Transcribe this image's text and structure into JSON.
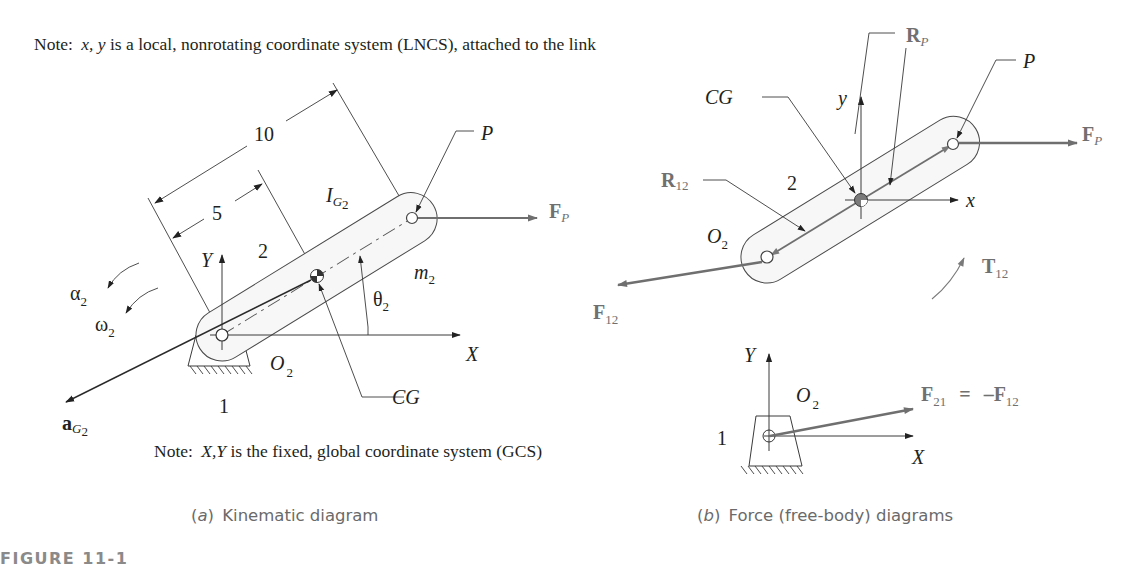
{
  "figure": {
    "number": "FIGURE 11-1",
    "top_note": {
      "prefix": "Note:",
      "vars": "x, y",
      "text": "is a local, nonrotating coordinate system (LNCS), attached to the link"
    },
    "bottom_note": {
      "prefix": "Note:",
      "vars": "X,Y",
      "text": "is the fixed, global coordinate system (GCS)"
    }
  },
  "part_a": {
    "caption_letter": "a",
    "caption_text": "Kinematic diagram",
    "dimensions": {
      "outer": "10",
      "inner": "5"
    },
    "labels": {
      "link_number": "2",
      "ground_number": "1",
      "point_p": "P",
      "force_p": "F",
      "force_p_sub": "P",
      "inertia": "I",
      "inertia_sub": "G",
      "inertia_sub2": "2",
      "mass": "m",
      "mass_sub": "2",
      "theta": "θ",
      "theta_sub": "2",
      "alpha": "α",
      "alpha_sub": "2",
      "omega": "ω",
      "omega_sub": "2",
      "axis_x": "X",
      "axis_y": "Y",
      "pivot": "O",
      "pivot_sub": "2",
      "cg": "CG",
      "accel": "a",
      "accel_sub": "G",
      "accel_sub2": "2"
    }
  },
  "part_b": {
    "caption_letter": "b",
    "caption_text": "Force (free-body) diagrams",
    "labels": {
      "link_number": "2",
      "ground_number": "1",
      "point_p": "P",
      "force_p": "F",
      "force_p_sub": "P",
      "r_p": "R",
      "r_p_sub": "P",
      "r_12": "R",
      "r_12_sub": "12",
      "cg": "CG",
      "local_x": "x",
      "local_y": "y",
      "pivot": "O",
      "pivot_sub": "2",
      "f_12": "F",
      "f_12_sub": "12",
      "torque": "T",
      "torque_sub": "12",
      "axis_x": "X",
      "axis_y": "Y",
      "f_21": "F",
      "f_21_sub": "21",
      "equals": "=",
      "neg_f12": "–F",
      "neg_f12_sub": "12"
    }
  },
  "colors": {
    "ink": "#231f20",
    "force_gray": "#6f6f6f",
    "caption_gray": "#6a6a6a",
    "figure_label_gray": "#8a8a8a",
    "link_fill_light": "#f4f4f4",
    "link_fill_dark": "#9a9a9a"
  }
}
